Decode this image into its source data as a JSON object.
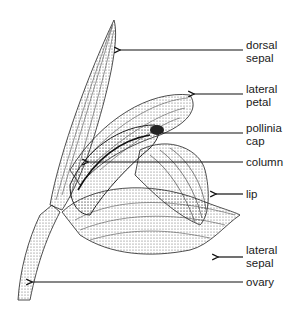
{
  "diagram": {
    "labels": [
      {
        "id": "dorsal-sepal",
        "lines": [
          "dorsal",
          "sepal"
        ]
      },
      {
        "id": "lateral-petal",
        "lines": [
          "lateral",
          "petal"
        ]
      },
      {
        "id": "pollinia-cap",
        "lines": [
          "pollinia",
          "cap"
        ]
      },
      {
        "id": "column",
        "lines": [
          "column"
        ]
      },
      {
        "id": "lip",
        "lines": [
          "lip"
        ]
      },
      {
        "id": "lateral-sepal",
        "lines": [
          "lateral",
          "sepal"
        ]
      },
      {
        "id": "ovary",
        "lines": [
          "ovary"
        ]
      }
    ],
    "colors": {
      "ink": "#1a1a1a",
      "stipple": "#555555",
      "background": "#ffffff"
    }
  }
}
